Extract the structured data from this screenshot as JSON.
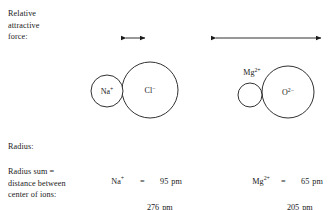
{
  "figure": {
    "title_label": "Relative\nattractive\nforce:",
    "radius_label": "Radius:",
    "radius_sum_label": "Radius sum =\ndistance between\ncenter of ions:",
    "stroke_color": "#1a1a1a",
    "background_color": "#ffffff"
  },
  "pairs": [
    {
      "id": "nacl",
      "cation": {
        "symbol": "Na",
        "charge": "+",
        "label": "Na⁺",
        "radius_pm": "95",
        "unit": "pm",
        "circle": {
          "cx": 107,
          "cy": 91,
          "r": 16
        },
        "label_inside": true
      },
      "anion": {
        "symbol": "Cl",
        "charge": "−",
        "label": "Cl⁻",
        "radius_pm": "181",
        "unit": "pm",
        "circle": {
          "cx": 150,
          "cy": 90,
          "r": 28
        },
        "label_inside": true
      },
      "arrow": {
        "x1": 126,
        "x2": 145,
        "y": 38
      },
      "radius_sum_pm": "276",
      "radius_sum_unit": "pm",
      "eq": "="
    },
    {
      "id": "mgo",
      "cation": {
        "symbol": "Mg",
        "charge": "2+",
        "label": "Mg²⁺",
        "radius_pm": "65",
        "unit": "pm",
        "circle": {
          "cx": 250,
          "cy": 95,
          "r": 12
        },
        "label_inside": false,
        "label_x": 252,
        "label_y": 72
      },
      "anion": {
        "symbol": "O",
        "charge": "2−",
        "label": "O²⁻",
        "radius_pm": "140",
        "unit": "pm",
        "circle": {
          "cx": 288,
          "cy": 92,
          "r": 26
        },
        "label_inside": true
      },
      "arrow": {
        "x1": 216,
        "x2": 321,
        "y": 38
      },
      "radius_sum_pm": "205",
      "radius_sum_unit": "pm",
      "eq": "="
    }
  ]
}
